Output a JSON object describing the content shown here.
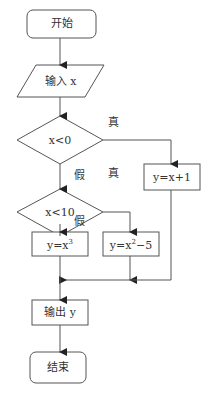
{
  "flowchart": {
    "nodes": {
      "start": {
        "type": "terminal",
        "label": "开始"
      },
      "input": {
        "type": "io",
        "label": "输入 x"
      },
      "cond1": {
        "type": "decision",
        "label": "x<0"
      },
      "cond2": {
        "type": "decision",
        "label": "x<10"
      },
      "proc_neg": {
        "type": "process",
        "label": "y=x+1"
      },
      "proc_cube": {
        "type": "process",
        "base": "y=x",
        "sup": "3"
      },
      "proc_sq": {
        "type": "process",
        "base": "y=x",
        "sup": "2",
        "tail": "−5"
      },
      "output": {
        "type": "io-rect",
        "label": "输出 y"
      },
      "end": {
        "type": "terminal",
        "label": "结束"
      }
    },
    "edge_labels": {
      "cond1_true": "真",
      "cond1_false": "假",
      "cond2_true": "真",
      "cond2_false": "假"
    },
    "colors": {
      "stroke": "#555555",
      "text": "#333333",
      "background": "#ffffff"
    }
  }
}
